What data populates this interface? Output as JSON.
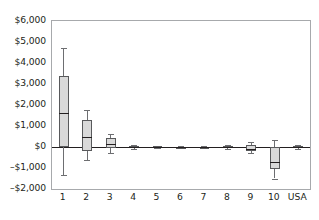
{
  "chart_data": {
    "type": "box",
    "title": "",
    "xlabel": "",
    "ylabel": "",
    "ylim": [
      -2000,
      6000
    ],
    "grid": false,
    "legend": false,
    "y_ticks": [
      {
        "value": 6000,
        "label": "$6,000"
      },
      {
        "value": 5000,
        "label": "$5,000"
      },
      {
        "value": 4000,
        "label": "$4,000"
      },
      {
        "value": 3000,
        "label": "$3,000"
      },
      {
        "value": 2000,
        "label": "$2,000"
      },
      {
        "value": 1000,
        "label": "$1,000"
      },
      {
        "value": 0,
        "label": "$0"
      },
      {
        "value": -1000,
        "label": "–$1,000"
      },
      {
        "value": -2000,
        "label": "–$2,000"
      }
    ],
    "categories": [
      "1",
      "2",
      "3",
      "4",
      "5",
      "6",
      "7",
      "8",
      "9",
      "10",
      "USA"
    ],
    "boxes": [
      {
        "category": "1",
        "min": -1320,
        "q1": 0,
        "median": 1620,
        "q3": 3400,
        "max": 4700
      },
      {
        "category": "2",
        "min": -620,
        "q1": -200,
        "median": 480,
        "q3": 1280,
        "max": 1760
      },
      {
        "category": "3",
        "min": -300,
        "q1": -60,
        "median": 150,
        "q3": 420,
        "max": 600
      },
      {
        "category": "4",
        "min": -110,
        "q1": -60,
        "median": 0,
        "q3": 60,
        "max": 110
      },
      {
        "category": "5",
        "min": -70,
        "q1": -30,
        "median": 0,
        "q3": 30,
        "max": 70
      },
      {
        "category": "6",
        "min": -50,
        "q1": -20,
        "median": 0,
        "q3": 20,
        "max": 50
      },
      {
        "category": "7",
        "min": -50,
        "q1": -20,
        "median": 0,
        "q3": 20,
        "max": 50
      },
      {
        "category": "8",
        "min": -80,
        "q1": -40,
        "median": 0,
        "q3": 40,
        "max": 80
      },
      {
        "category": "9",
        "min": -300,
        "q1": -200,
        "median": -100,
        "q3": 100,
        "max": 220
      },
      {
        "category": "10",
        "min": -1500,
        "q1": -1060,
        "median": -700,
        "q3": 10,
        "max": 350
      },
      {
        "category": "USA",
        "min": -90,
        "q1": -40,
        "median": 0,
        "q3": 40,
        "max": 90
      }
    ],
    "colors": {
      "box_fill": "#d9d9d9",
      "box_border": "#58595b",
      "median": "#231f20",
      "whisker": "#6d6e71",
      "frame": "#a7a9ac",
      "zero_line": "#231f20",
      "text": "#231f20",
      "background": "#ffffff"
    }
  }
}
